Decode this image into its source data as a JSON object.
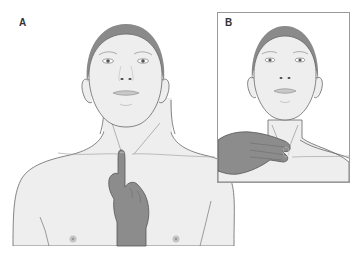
{
  "figure": {
    "panels": [
      {
        "label": "A",
        "description": "Frontal view of head and upper torso; gloved/darker hand with index finger pointing up, placed at suprasternal notch (center of base of neck)"
      },
      {
        "label": "B",
        "description": "Inset: frontal view of head and neck; hand with fingers laid flat across the front of the neck, fingertips at the trachea just above the sternal notch"
      }
    ]
  },
  "colors": {
    "skin": "#eeeeee",
    "outline": "#666666",
    "hair": "#8a8a8a",
    "hand": "#8c8c8c",
    "hand_outline": "#555555",
    "inset_border": "#999999",
    "background": "#ffffff",
    "label": "#333333"
  }
}
